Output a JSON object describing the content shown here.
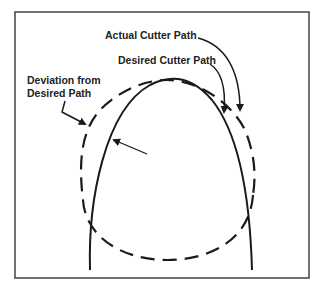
{
  "diagram": {
    "labels": {
      "actual_cutter_path": "Actual Cutter Path",
      "desired_cutter_path": "Desired Cutter Path",
      "deviation_line1": "Deviation from",
      "deviation_line2": "Desired Path"
    },
    "colors": {
      "stroke": "#1a1a1a",
      "frame": "#444444",
      "background": "#ffffff"
    }
  }
}
